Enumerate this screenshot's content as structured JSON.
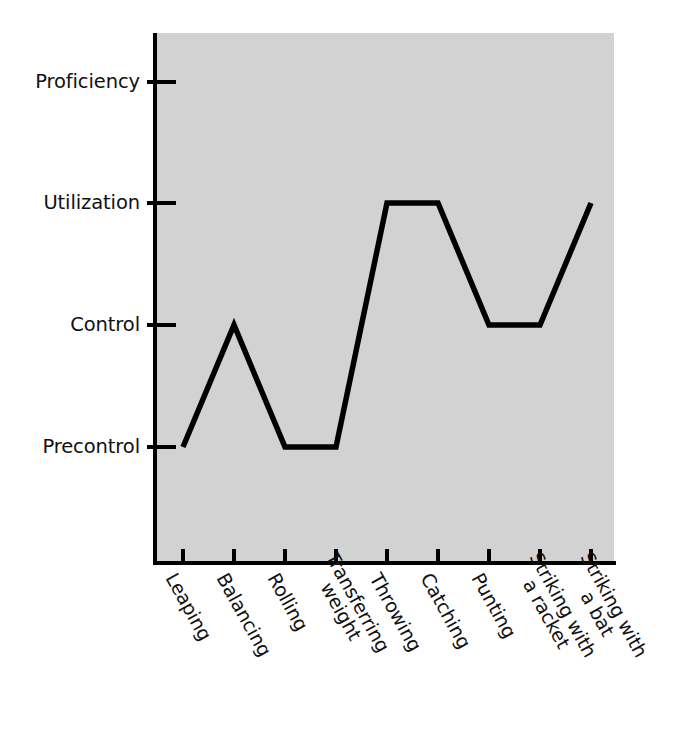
{
  "chart_data": {
    "type": "line",
    "title": "",
    "subtitle": "",
    "xlabel": "",
    "ylabel": "",
    "legend": [],
    "legend_position": "none",
    "grid": false,
    "plot_background_color": "#d2d2d2",
    "line_color": "#000000",
    "line_width_px": 5,
    "axis_color": "#000000",
    "y_axis": {
      "type": "ordinal",
      "tick_labels": [
        "Proficiency",
        "Utilization",
        "Control",
        "Precontrol"
      ],
      "order_top_to_bottom": [
        "Proficiency",
        "Utilization",
        "Control",
        "Precontrol"
      ],
      "levels": {
        "Precontrol": 1,
        "Control": 2,
        "Utilization": 3,
        "Proficiency": 4
      },
      "ylim": [
        0,
        4.7
      ]
    },
    "categories": [
      "Leaping",
      "Balancing",
      "Rolling",
      "Transferring weight",
      "Throwing",
      "Catching",
      "Punting",
      "Striking with a racket",
      "Striking with a bat"
    ],
    "category_label_lines": [
      [
        "Leaping"
      ],
      [
        "Balancing"
      ],
      [
        "Rolling"
      ],
      [
        "Transferring",
        "weight"
      ],
      [
        "Throwing"
      ],
      [
        "Catching"
      ],
      [
        "Punting"
      ],
      [
        "Striking with",
        "a racket"
      ],
      [
        "Striking with",
        "a bat"
      ]
    ],
    "values_text": [
      "Precontrol",
      "Control",
      "Precontrol",
      "Precontrol",
      "Utilization",
      "Utilization",
      "Control",
      "Control",
      "Utilization"
    ],
    "values": [
      1,
      2,
      1,
      1,
      3,
      3,
      2,
      2,
      3
    ]
  },
  "y_ticks": [
    {
      "label": "Proficiency"
    },
    {
      "label": "Utilization"
    },
    {
      "label": "Control"
    },
    {
      "label": "Precontrol"
    }
  ],
  "x_ticks": [
    {
      "line1": "Leaping",
      "line2": ""
    },
    {
      "line1": "Balancing",
      "line2": ""
    },
    {
      "line1": "Rolling",
      "line2": ""
    },
    {
      "line1": "Transferring",
      "line2": "weight"
    },
    {
      "line1": "Throwing",
      "line2": ""
    },
    {
      "line1": "Catching",
      "line2": ""
    },
    {
      "line1": "Punting",
      "line2": ""
    },
    {
      "line1": "Striking with",
      "line2": "a racket"
    },
    {
      "line1": "Striking with",
      "line2": "a bat"
    }
  ]
}
